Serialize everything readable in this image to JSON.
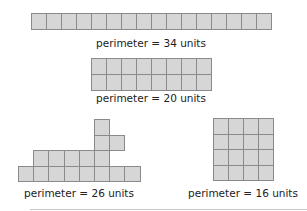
{
  "figures": [
    {
      "id": "strip-1x16",
      "label": "perimeter = 34 units",
      "rows": 1,
      "cols": 16,
      "origin": [
        31,
        13
      ],
      "cell": [
        15,
        16
      ],
      "label_pos": [
        151,
        36
      ]
    },
    {
      "id": "rect-2x8",
      "label": "perimeter = 20 units",
      "rows": 2,
      "cols": 8,
      "origin": [
        91,
        58
      ],
      "cell": [
        15,
        16
      ],
      "label_pos": [
        151,
        92
      ]
    },
    {
      "id": "irregular",
      "label": "perimeter = 26 units",
      "origin": [
        18,
        119
      ],
      "cell": [
        15.2,
        15.5
      ],
      "cells": [
        [
          0,
          5
        ],
        [
          1,
          5
        ],
        [
          1,
          6
        ],
        [
          2,
          1
        ],
        [
          2,
          2
        ],
        [
          2,
          3
        ],
        [
          2,
          4
        ],
        [
          2,
          5
        ],
        [
          3,
          0
        ],
        [
          3,
          1
        ],
        [
          3,
          2
        ],
        [
          3,
          3
        ],
        [
          3,
          4
        ],
        [
          3,
          5
        ],
        [
          3,
          6
        ],
        [
          3,
          7
        ]
      ],
      "label_pos": [
        79,
        187
      ]
    },
    {
      "id": "square-4x4",
      "label": "perimeter = 16 units",
      "rows": 4,
      "cols": 4,
      "origin": [
        213,
        118
      ],
      "cell": [
        15,
        15.5
      ],
      "label_pos": [
        243,
        187
      ]
    }
  ],
  "colors": {
    "fill": "#d6d6d6",
    "stroke": "#8a8a8a",
    "text": "#222222"
  }
}
